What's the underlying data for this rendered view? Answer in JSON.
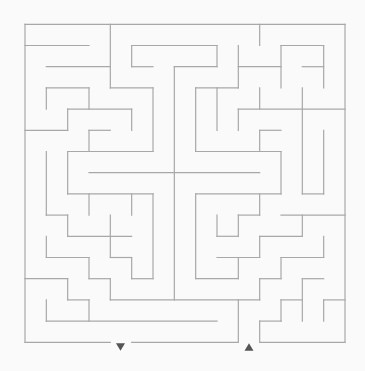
{
  "canvas": {
    "width": 365,
    "height": 371,
    "background": "#fafafa"
  },
  "maze": {
    "cols": 15,
    "rows": 15,
    "origin": {
      "x": 25,
      "y": 24.3
    },
    "cell": {
      "w": 21.333,
      "h": 21.2
    },
    "wall_color": "#a8a8a8",
    "horizontal_walls": [
      [
        0,
        0,
        15
      ],
      [
        1,
        0,
        3
      ],
      [
        1,
        5,
        9
      ],
      [
        1,
        12,
        14
      ],
      [
        2,
        1,
        4
      ],
      [
        2,
        5,
        6
      ],
      [
        2,
        7,
        9
      ],
      [
        2,
        10,
        12
      ],
      [
        2,
        13,
        14
      ],
      [
        3,
        1,
        3
      ],
      [
        3,
        4,
        6
      ],
      [
        3,
        8,
        10
      ],
      [
        4,
        2,
        5
      ],
      [
        4,
        10,
        15
      ],
      [
        5,
        0,
        2
      ],
      [
        5,
        3,
        4
      ],
      [
        5,
        11,
        12
      ],
      [
        6,
        2,
        6
      ],
      [
        6,
        8,
        12
      ],
      [
        7,
        3,
        11
      ],
      [
        8,
        2,
        6
      ],
      [
        8,
        8,
        12
      ],
      [
        8,
        13,
        14
      ],
      [
        9,
        1,
        2
      ],
      [
        9,
        10,
        11
      ],
      [
        9,
        12,
        15
      ],
      [
        10,
        2,
        5
      ],
      [
        10,
        9,
        10
      ],
      [
        10,
        11,
        13
      ],
      [
        11,
        1,
        3
      ],
      [
        11,
        4,
        5
      ],
      [
        11,
        9,
        11
      ],
      [
        11,
        12,
        14
      ],
      [
        12,
        0,
        2
      ],
      [
        12,
        3,
        4
      ],
      [
        12,
        5,
        6
      ],
      [
        12,
        8,
        10
      ],
      [
        12,
        11,
        12
      ],
      [
        12,
        13,
        14
      ],
      [
        13,
        2,
        3
      ],
      [
        13,
        4,
        11
      ],
      [
        13,
        12,
        13
      ],
      [
        13,
        14,
        15
      ],
      [
        14,
        1,
        9
      ],
      [
        14,
        11,
        12
      ],
      [
        15,
        0,
        4
      ],
      [
        15,
        5,
        10
      ],
      [
        15,
        11,
        15
      ]
    ],
    "vertical_walls": [
      [
        0,
        0,
        15
      ],
      [
        1,
        3,
        4
      ],
      [
        1,
        6,
        9
      ],
      [
        1,
        10,
        11
      ],
      [
        1,
        13,
        14
      ],
      [
        2,
        4,
        5
      ],
      [
        2,
        6,
        8
      ],
      [
        2,
        9,
        10
      ],
      [
        2,
        12,
        13
      ],
      [
        3,
        3,
        4
      ],
      [
        3,
        5,
        6
      ],
      [
        3,
        8,
        9
      ],
      [
        3,
        11,
        12
      ],
      [
        3,
        13,
        14
      ],
      [
        4,
        0,
        3
      ],
      [
        4,
        9,
        11
      ],
      [
        4,
        12,
        13
      ],
      [
        5,
        1,
        2
      ],
      [
        5,
        4,
        5
      ],
      [
        5,
        8,
        9
      ],
      [
        5,
        11,
        12
      ],
      [
        6,
        3,
        6
      ],
      [
        6,
        8,
        12
      ],
      [
        7,
        2,
        13
      ],
      [
        8,
        3,
        6
      ],
      [
        8,
        8,
        12
      ],
      [
        9,
        1,
        2
      ],
      [
        9,
        3,
        5
      ],
      [
        9,
        9,
        10
      ],
      [
        10,
        1,
        3
      ],
      [
        10,
        4,
        5
      ],
      [
        10,
        9,
        10
      ],
      [
        10,
        11,
        12
      ],
      [
        10,
        13,
        15
      ],
      [
        11,
        0,
        1
      ],
      [
        11,
        3,
        4
      ],
      [
        11,
        5,
        6
      ],
      [
        11,
        8,
        9
      ],
      [
        11,
        10,
        11
      ],
      [
        11,
        12,
        13
      ],
      [
        11,
        14,
        15
      ],
      [
        12,
        1,
        3
      ],
      [
        12,
        6,
        8
      ],
      [
        12,
        11,
        12
      ],
      [
        12,
        13,
        14
      ],
      [
        13,
        3,
        8
      ],
      [
        13,
        9,
        10
      ],
      [
        13,
        12,
        14
      ],
      [
        14,
        1,
        3
      ],
      [
        14,
        5,
        8
      ],
      [
        14,
        10,
        11
      ],
      [
        14,
        13,
        14
      ],
      [
        15,
        0,
        15
      ]
    ],
    "entrance": {
      "glyph": "down-triangle",
      "col": 4,
      "x": 120.5,
      "y": 347,
      "color": "#555555"
    },
    "exit": {
      "glyph": "up-triangle",
      "col": 10,
      "x": 249,
      "y": 347,
      "color": "#555555"
    }
  }
}
